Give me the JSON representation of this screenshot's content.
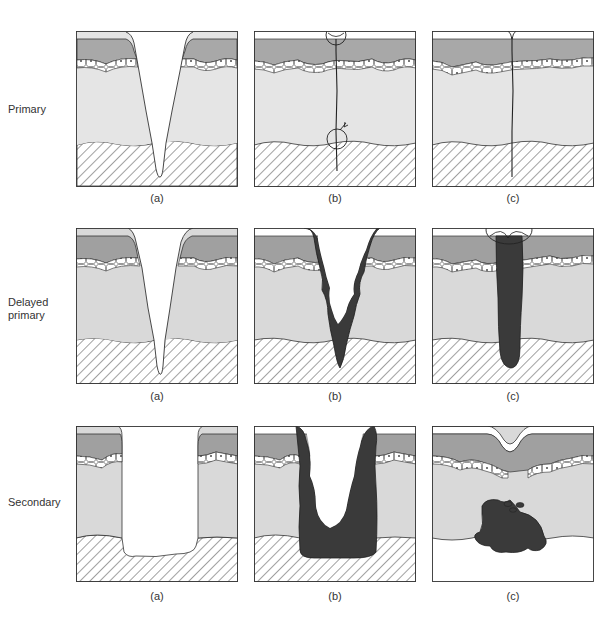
{
  "figure": {
    "rows": [
      {
        "label": "Primary",
        "panels": [
          "(a)",
          "(b)",
          "(c)"
        ]
      },
      {
        "label": "Delayed\nprimary",
        "label_lines": [
          "Delayed",
          "primary"
        ],
        "panels": [
          "(a)",
          "(b)",
          "(c)"
        ]
      },
      {
        "label": "Secondary",
        "panels": [
          "(a)",
          "(b)",
          "(c)"
        ]
      }
    ],
    "colors": {
      "stratum_corneum": "#ffffff",
      "epidermis": "#a9a9a9",
      "basal_cells": "#ffffff",
      "dermis": "#e4e4e4",
      "subcutis_hatch": "#444444",
      "granulation": "#3a3a3a",
      "outline": "#333333"
    }
  }
}
